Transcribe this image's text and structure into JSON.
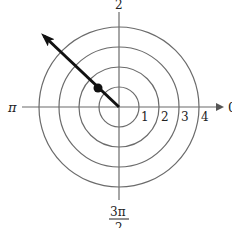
{
  "diagram": {
    "type": "polar-grid",
    "center": [
      119,
      107
    ],
    "unit_px": 20,
    "circles": [
      1,
      2,
      3,
      4
    ],
    "radius_labels": [
      "1",
      "2",
      "3",
      "4"
    ],
    "angle_labels": {
      "zero": "0",
      "half_pi": "2",
      "pi": "π",
      "three_half_pi_num": "3π",
      "three_half_pi_den": "2"
    },
    "ray": {
      "angle": "3π/4",
      "arrow": true
    },
    "point": {
      "r": 1.5,
      "theta": "3π/4"
    },
    "colors": {
      "grid": "#6b6b6b",
      "ray": "#111111",
      "text": "#222222"
    }
  }
}
